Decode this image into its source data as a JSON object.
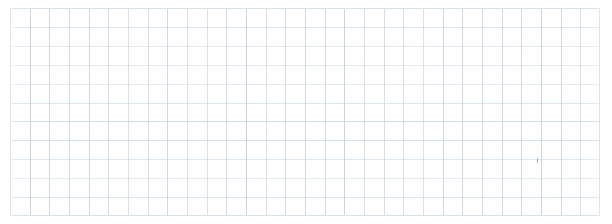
{
  "document": {
    "kind": "graph-paper-sheet",
    "description": "Blank quadrille / graph paper scan with no written content",
    "width": 612,
    "height": 224,
    "paper_color": "#fefeff",
    "page_background": "#ffffff"
  },
  "grid": {
    "left": 10,
    "top": 8,
    "right": 600,
    "bottom": 216,
    "width": 590,
    "height": 208,
    "columns": 30,
    "rows": 11,
    "cell_width": 19.67,
    "cell_height": 18.9,
    "vertical_line_color": "#b9c4cf",
    "horizontal_line_color": "#c3d4e0",
    "border_color": "#d2dce4",
    "line_width": 1
  },
  "annotations": {
    "marks": [
      {
        "name": "pencil-tick",
        "x": 537,
        "y": 157,
        "width": 1,
        "height": 7,
        "color": "#6a6f78"
      }
    ]
  }
}
